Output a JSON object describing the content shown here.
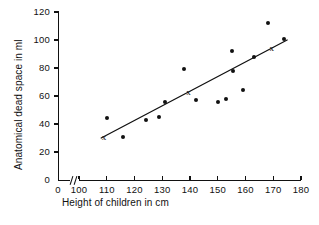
{
  "chart_data": {
    "type": "scatter",
    "title": "",
    "xlabel": "Height of children in cm",
    "ylabel": "Anatomical dead space in ml",
    "xlim": [
      100,
      180
    ],
    "ylim": [
      0,
      120
    ],
    "x_axis_break": true,
    "x_break_label": "0",
    "xticks": [
      100,
      110,
      120,
      130,
      140,
      150,
      160,
      170,
      180
    ],
    "xticklabels": [
      "100",
      "110",
      "120",
      "130",
      "140",
      "150",
      "160",
      "170",
      "180"
    ],
    "yticks": [
      0,
      20,
      40,
      60,
      80,
      100,
      120
    ],
    "yticklabels": [
      "0",
      "20",
      "40",
      "60",
      "80",
      "100",
      "120"
    ],
    "grid": false,
    "legend": null,
    "points": [
      {
        "x": 110.0,
        "y": 44.0
      },
      {
        "x": 116.0,
        "y": 31.0
      },
      {
        "x": 124.0,
        "y": 43.0
      },
      {
        "x": 129.0,
        "y": 45.0
      },
      {
        "x": 131.0,
        "y": 56.0
      },
      {
        "x": 138.0,
        "y": 79.0
      },
      {
        "x": 142.0,
        "y": 57.0
      },
      {
        "x": 150.0,
        "y": 56.0
      },
      {
        "x": 153.0,
        "y": 58.0
      },
      {
        "x": 155.0,
        "y": 92.0
      },
      {
        "x": 155.5,
        "y": 78.0
      },
      {
        "x": 159.0,
        "y": 64.0
      },
      {
        "x": 163.0,
        "y": 88.0
      },
      {
        "x": 168.0,
        "y": 112.0
      },
      {
        "x": 174.0,
        "y": 101.0
      }
    ],
    "cross_markers": [
      {
        "x": 109.0,
        "y": 31.0,
        "glyph": "x"
      },
      {
        "x": 139.5,
        "y": 63.0,
        "glyph": "x"
      },
      {
        "x": 169.5,
        "y": 94.0,
        "glyph": "x"
      }
    ],
    "regression_line": {
      "x_start": 108.0,
      "y_start": 30.0,
      "x_end": 175.0,
      "y_end": 100.0
    }
  }
}
